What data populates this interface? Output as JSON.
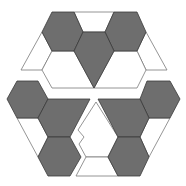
{
  "diagram": {
    "title": "",
    "colors": {
      "shaded": "#6e6e6e",
      "outline": "#3a3a3a",
      "light": "#ffffff",
      "light_outline": "#7a7a7a",
      "background": "#ffffff"
    },
    "pieces": [
      {
        "name": "top-piece",
        "shapes": [
          {
            "name": "top-left-hexagon",
            "type": "dark",
            "points": "52,12 74,12 83,32 74,51 52,51 42,32"
          },
          {
            "name": "top-right-hexagon",
            "type": "dark",
            "points": "114,12 137,12 146,32 137,51 114,51 105,32"
          },
          {
            "name": "top-center-kite",
            "type": "dark",
            "points": "83,32 105,32 114,51 94,88 74,51"
          },
          {
            "name": "top-middle-trapezoid",
            "type": "light",
            "points": "74,12 114,12 105,32 83,32"
          },
          {
            "name": "top-left-outer-parallelogram",
            "type": "light",
            "points": "42,32 52,51 42,70 21,70"
          },
          {
            "name": "top-right-outer-parallelogram",
            "type": "light",
            "points": "146,32 167,70 146,70 137,51"
          },
          {
            "name": "top-left-lower-quad",
            "type": "light",
            "points": "52,51 74,51 94,88 52,88 42,70"
          },
          {
            "name": "top-right-lower-quad",
            "type": "light",
            "points": "114,51 137,51 146,70 137,88 94,88"
          }
        ]
      },
      {
        "name": "bottom-left-piece",
        "shapes": [
          {
            "name": "bl-top-hexagon",
            "type": "dark",
            "points": "17,81 38,81 48,99 38,118 17,118 7,99"
          },
          {
            "name": "bl-middle-quad",
            "type": "dark",
            "points": "48,99 90,99 70,137 48,137 38,118"
          },
          {
            "name": "bl-bottom-hexagon",
            "type": "dark",
            "points": "48,137 70,137 81,157 70,176 48,176 38,157"
          },
          {
            "name": "bl-left-white",
            "type": "light",
            "points": "17,118 38,118 48,137 38,157"
          }
        ]
      },
      {
        "name": "bottom-right-piece",
        "shapes": [
          {
            "name": "br-top-hexagon",
            "type": "dark",
            "points": "147,81 170,81 180,99 170,118 149,118 140,99"
          },
          {
            "name": "br-middle-quad",
            "type": "dark",
            "points": "98,99 140,99 149,118 140,137 118,137"
          },
          {
            "name": "br-bottom-hexagon",
            "type": "dark",
            "points": "118,137 140,137 149,157 140,176 118,176 108,157"
          },
          {
            "name": "br-right-white",
            "type": "light",
            "points": "149,118 170,118 149,157 140,137"
          },
          {
            "name": "br-inner-white",
            "type": "light",
            "points": "96,102 118,137 108,157 86,157 79,144 84,137 78,130"
          },
          {
            "name": "br-bottom-white",
            "type": "light",
            "points": "86,157 108,157 118,176 76,176"
          }
        ]
      }
    ]
  }
}
